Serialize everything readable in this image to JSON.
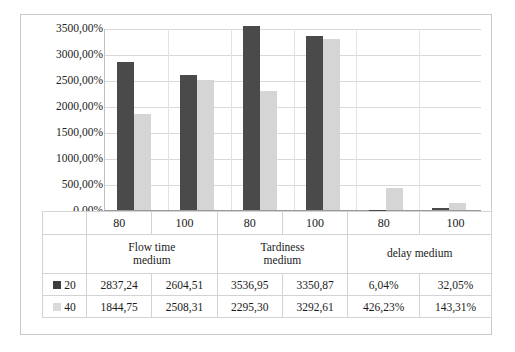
{
  "chart_data": {
    "type": "bar",
    "title": "",
    "subtitle": "",
    "xlabel": "",
    "ylabel": "",
    "ylim": [
      0,
      3500
    ],
    "yticks": [
      "0,00%",
      "500,00%",
      "1000,00%",
      "1500,00%",
      "2000,00%",
      "2500,00%",
      "3000,00%",
      "3500,00%"
    ],
    "ytick_values": [
      0,
      500,
      1000,
      1500,
      2000,
      2500,
      3000,
      3500
    ],
    "grid": true,
    "legend_position": "table-left",
    "groups": [
      "Flow time medium",
      "Tardiness medium",
      "delay medium"
    ],
    "group_labels": [
      {
        "line1": "Flow time",
        "line2": "medium"
      },
      {
        "line1": "Tardiness",
        "line2": "medium"
      },
      {
        "line1": "delay medium",
        "line2": ""
      }
    ],
    "subcategories": [
      "80",
      "100",
      "80",
      "100",
      "80",
      "100"
    ],
    "categories": [
      "Flow time medium / 80",
      "Flow time medium / 100",
      "Tardiness medium / 80",
      "Tardiness medium / 100",
      "delay medium / 80",
      "delay medium / 100"
    ],
    "series": [
      {
        "name": "20",
        "color": "#4a4a4a",
        "values": [
          2837.24,
          2604.51,
          3536.95,
          3350.87,
          6.04,
          32.05
        ],
        "labels": [
          "2837,24",
          "2604,51",
          "3536,95",
          "3350,87",
          "6,04%",
          "32,05%"
        ]
      },
      {
        "name": "40",
        "color": "#d5d5d5",
        "values": [
          1844.75,
          2508.31,
          2295.3,
          3292.61,
          426.23,
          143.31
        ],
        "labels": [
          "1844,75",
          "2508,31",
          "2295,30",
          "3292,61",
          "426,23%",
          "143,31%"
        ]
      }
    ]
  },
  "table": {
    "rows": [
      {
        "legend": "20",
        "swatch": "dark-swatch",
        "cells": [
          "2837,24",
          "2604,51",
          "3536,95",
          "3350,87",
          "6,04%",
          "32,05%"
        ]
      },
      {
        "legend": "40",
        "swatch": "light-swatch",
        "cells": [
          "1844,75",
          "2508,31",
          "2295,30",
          "3292,61",
          "426,23%",
          "143,31%"
        ]
      }
    ]
  },
  "colors": {
    "series_20": "#4a4a4a",
    "series_40": "#d5d5d5",
    "gridline": "#d9d9d9",
    "frame": "#c9c9c9",
    "table_border": "#d3d3d3"
  }
}
